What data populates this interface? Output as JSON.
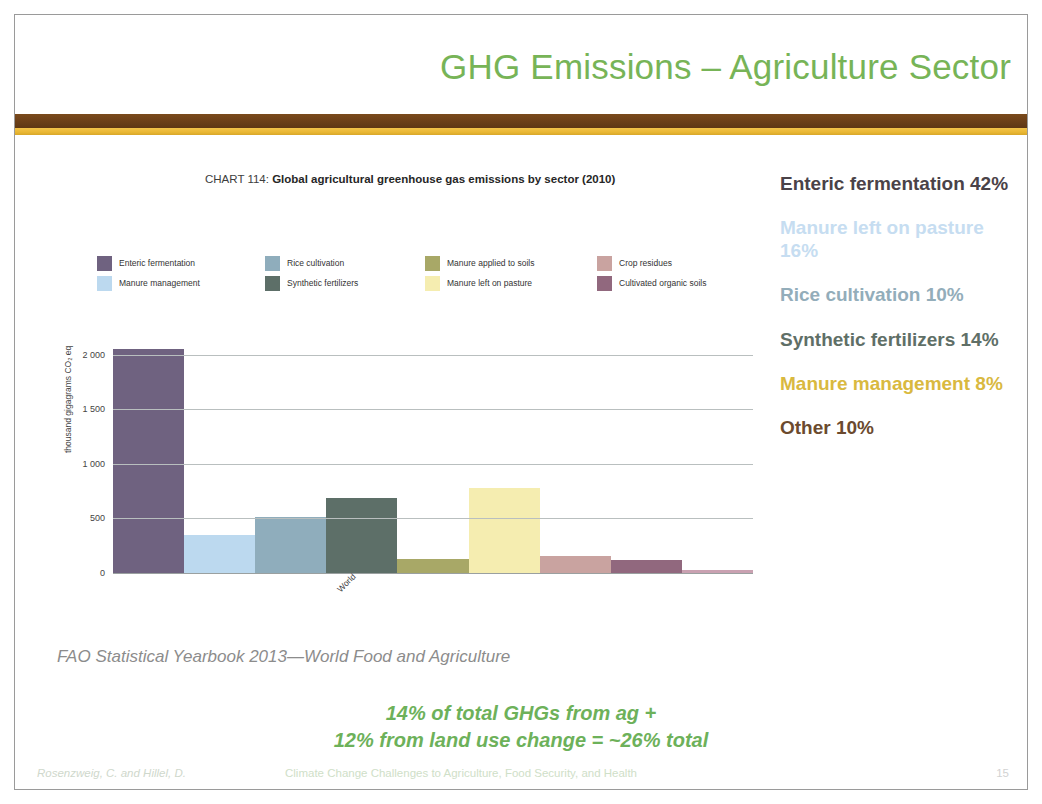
{
  "header": {
    "title": "GHG Emissions – Agriculture Sector",
    "title_color": "#77b457",
    "band_brown": "#6b3f18",
    "band_gold": "#e9b733"
  },
  "chart_data": {
    "type": "bar",
    "title_prefix": "CHART 114: ",
    "title": "Global agricultural greenhouse gas emissions by sector (2010)",
    "xlabel": "World",
    "ylabel": "thousand gigagrams CO₂ eq",
    "ylim": [
      0,
      2200
    ],
    "yticks": [
      "0",
      "500",
      "1 000",
      "1 500",
      "2 000"
    ],
    "ytick_values": [
      0,
      500,
      1000,
      1500,
      2000
    ],
    "grid": true,
    "legend_position": "top",
    "categories": [
      "Enteric fermentation",
      "Manure management",
      "Rice cultivation",
      "Synthetic fertilizers",
      "Manure applied to soils",
      "Manure left on pasture",
      "Crop residues",
      "Cultivated organic soils",
      "Burning crop residues"
    ],
    "values": [
      2050,
      350,
      510,
      690,
      125,
      780,
      160,
      115,
      25
    ],
    "colors": [
      "#6f6280",
      "#bcd9ef",
      "#8fadbc",
      "#5d6f68",
      "#a8a867",
      "#f5edb0",
      "#c9a3a0",
      "#91687e",
      "#c9a1b1"
    ],
    "source": "FAO Statistical Yearbook 2013—World Food and Agriculture"
  },
  "callouts": [
    {
      "text": "Enteric fermentation 42%",
      "color": "#4a4248"
    },
    {
      "text": "Manure left on pasture 16%",
      "color": "#c6ddf1"
    },
    {
      "text": "Rice cultivation 10%",
      "color": "#93adba"
    },
    {
      "text": "Synthetic fertilizers 14%",
      "color": "#5f6f67"
    },
    {
      "text": "Manure management 8%",
      "color": "#d9b93f"
    },
    {
      "text": "Other 10%",
      "color": "#6b4a2e"
    }
  ],
  "statement": {
    "line1": "14% of total GHGs from ag +",
    "line2": "12% from land use change = ~26% total",
    "color": "#6db15a"
  },
  "footer": {
    "authors": "Rosenzweig, C. and Hillel, D.",
    "course": "Climate Change Challenges to Agriculture, Food Security, and Health",
    "page": "15"
  }
}
